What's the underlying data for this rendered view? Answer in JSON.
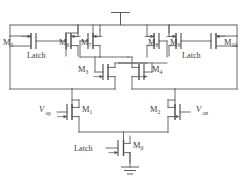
{
  "figure": {
    "type": "circuit-schematic"
  },
  "power": {
    "vdd_symbol": "vdd-bar",
    "gnd_symbol": "ground-symbol"
  },
  "labels": {
    "latch_left": "Latch",
    "latch_right": "Latch",
    "latch_bottom": "Latch",
    "vin_p_base": "V",
    "vin_p_sub": "op",
    "vin_n_base": "V",
    "vin_n_sub": "on"
  },
  "transistors": [
    {
      "id": "M5",
      "base": "M",
      "sub": "5",
      "kind": "pmos",
      "role": "left-latch-load"
    },
    {
      "id": "M6",
      "base": "M",
      "sub": "6",
      "kind": "pmos",
      "role": "left-latch-load"
    },
    {
      "id": "M7",
      "base": "M",
      "sub": "7",
      "kind": "pmos",
      "role": "left-cross-coupled"
    },
    {
      "id": "M8",
      "base": "M",
      "sub": "8",
      "kind": "pmos",
      "role": "right-cross-coupled"
    },
    {
      "id": "M9",
      "base": "M",
      "sub": "9",
      "kind": "pmos",
      "role": "right-latch-load"
    },
    {
      "id": "M10",
      "base": "M",
      "sub": "10",
      "kind": "pmos",
      "role": "right-latch-load"
    },
    {
      "id": "M3",
      "base": "M",
      "sub": "3",
      "kind": "nmos",
      "role": "left-cross-coupled"
    },
    {
      "id": "M4",
      "base": "M",
      "sub": "4",
      "kind": "nmos",
      "role": "right-cross-coupled"
    },
    {
      "id": "M1",
      "base": "M",
      "sub": "1",
      "kind": "nmos",
      "role": "input-pair-left"
    },
    {
      "id": "M2",
      "base": "M",
      "sub": "2",
      "kind": "nmos",
      "role": "input-pair-right"
    },
    {
      "id": "M0",
      "base": "M",
      "sub": "0",
      "kind": "nmos",
      "role": "tail-switch"
    }
  ],
  "colors": {
    "wire": "#5a5a5a",
    "device": "#4a4a4a",
    "text": "#3c3c3c",
    "background": "#ffffff"
  }
}
